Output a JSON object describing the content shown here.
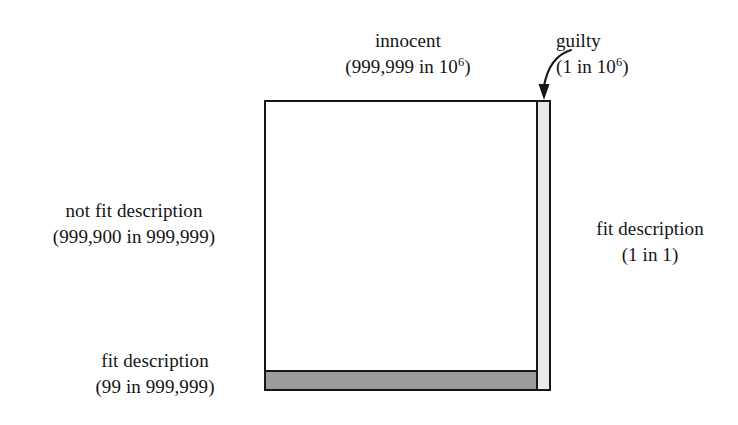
{
  "diagram": {
    "type": "proportional-area-diagram",
    "colors": {
      "outline": "#171717",
      "innocent_fill": "#ffffff",
      "innocent_fit_band_fill": "#9c9c9c",
      "guilty_column_fill": "#e9e9e9",
      "page_background": "#ffffff"
    },
    "labels": {
      "innocent": {
        "title": "innocent",
        "detail_prefix": "(999,999 in 10",
        "detail_exponent": "6",
        "detail_suffix": ")"
      },
      "guilty": {
        "title": "guilty",
        "detail_prefix": "(1 in 10",
        "detail_exponent": "6",
        "detail_suffix": ")"
      },
      "not_fit_description": {
        "title": "not fit description",
        "detail": "(999,900 in 999,999)"
      },
      "fit_description_innocent": {
        "title": "fit description",
        "detail": "(99 in 999,999)"
      },
      "fit_description_guilty": {
        "title": "fit description",
        "detail": "(1 in 1)"
      }
    },
    "regions": [
      {
        "name": "innocent",
        "count": 999999,
        "of": 1000000,
        "subregions": [
          {
            "name": "not fit description",
            "count": 999900,
            "of": 999999
          },
          {
            "name": "fit description",
            "count": 99,
            "of": 999999
          }
        ]
      },
      {
        "name": "guilty",
        "count": 1,
        "of": 1000000,
        "subregions": [
          {
            "name": "fit description",
            "count": 1,
            "of": 1
          }
        ]
      }
    ]
  }
}
